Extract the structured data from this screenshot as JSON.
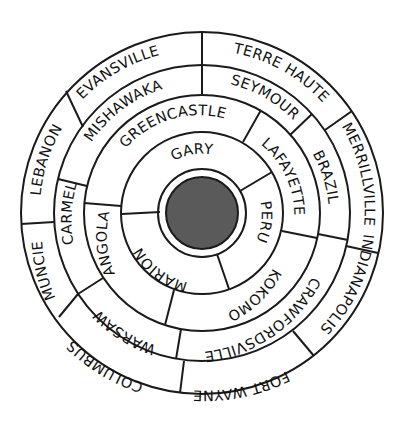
{
  "diagram": {
    "center": {
      "x": 202,
      "y": 213
    },
    "core": {
      "radius": 36,
      "color": "#5a5a5a"
    },
    "ring_radii": [
      44,
      81,
      118,
      148,
      181
    ],
    "rings": [
      {
        "name": "ring-1",
        "segments": [
          {
            "label": "GARY",
            "start": 250,
            "end": 60
          },
          {
            "label": "PERU",
            "start": 60,
            "end": 160
          },
          {
            "label": "MARION",
            "start": 160,
            "end": 250
          }
        ]
      },
      {
        "name": "ring-2",
        "segments": [
          {
            "label": "GREENCASTLE",
            "start": 265,
            "end": 30
          },
          {
            "label": "LAFAYETTE",
            "start": 30,
            "end": 103
          },
          {
            "label": "KOKOMO",
            "start": 103,
            "end": 193
          },
          {
            "label": "ANGOLA",
            "start": 193,
            "end": 265
          }
        ]
      },
      {
        "name": "ring-3",
        "segments": [
          {
            "label": "MISHAWAKA",
            "start": 283,
            "end": 0
          },
          {
            "label": "SEYMOUR",
            "start": 0,
            "end": 48
          },
          {
            "label": "BRAZIL",
            "start": 48,
            "end": 100
          },
          {
            "label": "CRAWFORDSVILLE",
            "start": 100,
            "end": 190
          },
          {
            "label": "WARSAW",
            "start": 190,
            "end": 237
          },
          {
            "label": "CARMEL",
            "start": 237,
            "end": 283
          }
        ]
      },
      {
        "name": "ring-4",
        "segments": [
          {
            "label": "EVANSVILLE",
            "start": 299,
            "end": 0
          },
          {
            "label": "TERRE HAUTE",
            "start": 0,
            "end": 56
          },
          {
            "label": "MERRILLVILLE",
            "start": 56,
            "end": 103
          },
          {
            "label": "INDIANAPOLIS",
            "start": 103,
            "end": 150
          },
          {
            "label": "FORT WAYNE",
            "start": 150,
            "end": 187
          },
          {
            "label": "COLUMBUS",
            "start": 187,
            "end": 236
          },
          {
            "label": "MUNCIE",
            "start": 236,
            "end": 266
          },
          {
            "label": "LEBANON",
            "start": 266,
            "end": 299
          }
        ]
      }
    ],
    "labels": {
      "gary": "GARY",
      "peru": "PERU",
      "marion": "MARION",
      "greencastle": "GREENCASTLE",
      "lafayette": "LAFAYETTE",
      "kokomo": "KOKOMO",
      "angola": "ANGOLA",
      "mishawaka": "MISHAWAKA",
      "seymour": "SEYMOUR",
      "brazil": "BRAZIL",
      "crawfordsville": "CRAWFORDSVILLE",
      "warsaw": "WARSAW",
      "carmel": "CARMEL",
      "evansville": "EVANSVILLE",
      "terre_haute": "TERRE HAUTE",
      "merrillville": "MERRILLVILLE",
      "indianapolis": "INDIANAPOLIS",
      "fort_wayne": "FORT WAYNE",
      "columbus": "COLUMBUS",
      "muncie": "MUNCIE",
      "lebanon": "LEBANON"
    }
  }
}
